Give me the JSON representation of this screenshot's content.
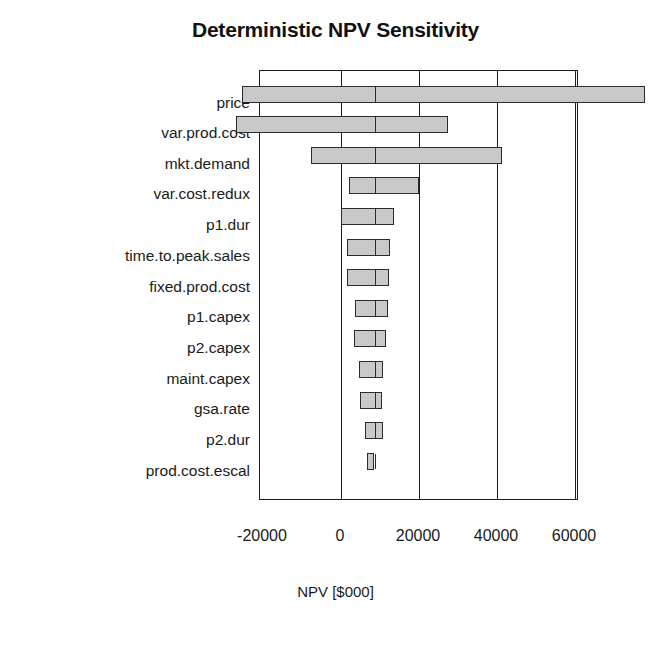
{
  "chart_data": {
    "type": "bar",
    "subtype": "tornado",
    "title": "Deterministic NPV Sensitivity",
    "xlabel": "NPV [$000]",
    "ylabel": "",
    "xlim": [
      -28500,
      82000
    ],
    "xticks": [
      -20000,
      0,
      20000,
      40000,
      60000
    ],
    "xtick_labels": [
      "-20000",
      "0",
      "20000",
      "40000",
      "60000"
    ],
    "grid": true,
    "grid_axis": "x",
    "legend": null,
    "base_value": 8500,
    "bar_color": "#c9c9c9",
    "bar_edge_color": "#2b2b2b",
    "categories": [
      "price",
      "var.prod.cost",
      "mkt.demand",
      "var.cost.redux",
      "p1.dur",
      "time.to.peak.sales",
      "fixed.prod.cost",
      "p1.capex",
      "p2.capex",
      "maint.capex",
      "gsa.rate",
      "p2.dur",
      "prod.cost.escal"
    ],
    "bars": [
      {
        "label": "price",
        "low": -25300,
        "high": 77900,
        "base": 8500,
        "span": 103200
      },
      {
        "label": "var.prod.cost",
        "low": -26800,
        "high": 27400,
        "base": 8500,
        "span": 54200
      },
      {
        "label": "mkt.demand",
        "low": -7700,
        "high": 41300,
        "base": 8500,
        "span": 49000
      },
      {
        "label": "var.cost.redux",
        "low": 2100,
        "high": 19900,
        "base": 8500,
        "span": 17800
      },
      {
        "label": "p1.dur",
        "low": 0,
        "high": 13700,
        "base": 8500,
        "span": 13700
      },
      {
        "label": "time.to.peak.sales",
        "low": 1550,
        "high": 12650,
        "base": 8500,
        "span": 11100
      },
      {
        "label": "fixed.prod.cost",
        "low": 1550,
        "high": 12400,
        "base": 8500,
        "span": 10850
      },
      {
        "label": "p1.capex",
        "low": 3600,
        "high": 12150,
        "base": 8500,
        "span": 8550
      },
      {
        "label": "p2.capex",
        "low": 3350,
        "high": 11600,
        "base": 8500,
        "span": 8250
      },
      {
        "label": "maint.capex",
        "low": 4650,
        "high": 10850,
        "base": 8500,
        "span": 6200
      },
      {
        "label": "gsa.rate",
        "low": 4900,
        "high": 10600,
        "base": 8500,
        "span": 5700
      },
      {
        "label": "p2.dur",
        "low": 6200,
        "high": 10850,
        "base": 8500,
        "span": 4650
      },
      {
        "label": "prod.cost.escal",
        "low": 6700,
        "high": 8500,
        "base": 8500,
        "span": 1800
      }
    ]
  }
}
